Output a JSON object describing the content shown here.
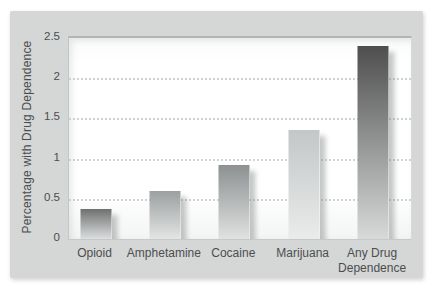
{
  "chart_data": {
    "type": "bar",
    "title": "",
    "categories": [
      "Opioid",
      "Amphetamine",
      "Cocaine",
      "Marijuana",
      "Any Drug\nDependence"
    ],
    "values": [
      0.37,
      0.6,
      0.92,
      1.35,
      2.4
    ],
    "xlabel": "",
    "ylabel": "Percentage with Drug Dependence",
    "ylim": [
      0,
      2.5
    ],
    "yticks": [
      0,
      0.5,
      1,
      1.5,
      2,
      2.5
    ],
    "ytick_labels": [
      "0",
      "0.5",
      "1",
      "1.5",
      "2",
      "2.5"
    ],
    "grid": "horizontal-dotted",
    "legend": "none"
  },
  "style": {
    "panel_background": "#d5d6d6",
    "plot_background": "#ffffff",
    "grid_color": "#c9cccc",
    "frame_color": "#b2b5b5",
    "text_color": "#4b4e4e",
    "bar_shadow_color": "rgba(128,132,132,0.45)",
    "bar_gradients": [
      {
        "top": "#6f6f6f",
        "bottom": "#dcdfe0"
      },
      {
        "top": "#9ca0a0",
        "bottom": "#e3e4e4"
      },
      {
        "top": "#8d9191",
        "bottom": "#e0e1e1"
      },
      {
        "top": "#c3c7c7",
        "bottom": "#eaebeb"
      },
      {
        "top": "#4e4e4e",
        "bottom": "#d8dada"
      }
    ]
  }
}
